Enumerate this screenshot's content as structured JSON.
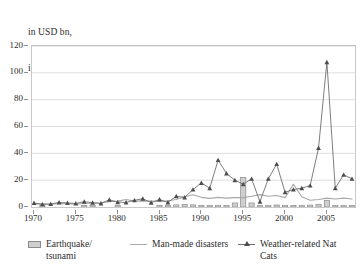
{
  "title": {
    "line1": "in USD bn,",
    "line2": "indexed to 2007"
  },
  "legend": {
    "items": [
      {
        "label": "Earthquake/\ntsunami",
        "marker": "bar-swatch-icon",
        "color": "#cfcfcf"
      },
      {
        "label": "Man-made disasters",
        "marker": "line-swatch-icon",
        "color": "#a8a8a8"
      },
      {
        "label": "Weather-related Nat\nCats",
        "marker": "line-triangle-swatch-icon",
        "color": "#6f6f6f"
      }
    ]
  },
  "chart_data": {
    "type": "line",
    "title": "in USD bn, indexed to 2007",
    "xlabel": "",
    "ylabel": "",
    "xlim": [
      1970,
      2008
    ],
    "ylim": [
      0,
      120
    ],
    "yticks": [
      0,
      20,
      40,
      60,
      80,
      100,
      120
    ],
    "xticks": [
      1970,
      1975,
      1980,
      1985,
      1990,
      1995,
      2000,
      2005
    ],
    "grid": true,
    "legend_position": "bottom",
    "x": [
      1970,
      1971,
      1972,
      1973,
      1974,
      1975,
      1976,
      1977,
      1978,
      1979,
      1980,
      1981,
      1982,
      1983,
      1984,
      1985,
      1986,
      1987,
      1988,
      1989,
      1990,
      1991,
      1992,
      1993,
      1994,
      1995,
      1996,
      1997,
      1998,
      1999,
      2000,
      2001,
      2002,
      2003,
      2004,
      2005,
      2006,
      2007,
      2008
    ],
    "series": [
      {
        "name": "Earthquake/tsunami",
        "type": "bar",
        "color": "#cfcfcf",
        "values": [
          0,
          0.3,
          0,
          0,
          0,
          0,
          0.5,
          0.4,
          0,
          0,
          0.3,
          0,
          0,
          0,
          0,
          1.2,
          1.0,
          1.6,
          2.0,
          1.6,
          1.2,
          0.5,
          0.6,
          0.6,
          3.0,
          22.0,
          3.0,
          0.4,
          0.5,
          1.5,
          0.6,
          0.5,
          0.4,
          1.4,
          2.0,
          5.0,
          1.0,
          0.4,
          0.6
        ]
      },
      {
        "name": "Man-made disasters",
        "type": "line",
        "color": "#a8a8a8",
        "values": [
          2.0,
          2.4,
          2.0,
          2.6,
          2.4,
          2.0,
          2.6,
          3.0,
          3.2,
          4.0,
          4.4,
          5.6,
          4.4,
          4.6,
          4.4,
          4.2,
          4.6,
          5.6,
          7.6,
          9.2,
          7.2,
          6.4,
          7.2,
          6.6,
          7.0,
          7.0,
          8.0,
          9.2,
          8.0,
          8.6,
          7.0,
          17.0,
          7.6,
          5.0,
          5.6,
          6.6,
          6.0,
          6.6,
          6.0
        ]
      },
      {
        "name": "Weather-related Nat Cats",
        "type": "line-marker",
        "color": "#6f6f6f",
        "values": [
          3.0,
          2.0,
          2.2,
          3.4,
          3.0,
          2.6,
          4.0,
          3.2,
          2.6,
          5.4,
          3.6,
          3.4,
          5.0,
          6.2,
          3.2,
          5.6,
          3.4,
          8.0,
          7.2,
          13.0,
          18.0,
          14.0,
          35.0,
          25.0,
          20.0,
          17.0,
          21.0,
          4.0,
          21.0,
          32.0,
          11.0,
          13.0,
          14.0,
          16.0,
          44.0,
          108.0,
          14.0,
          24.0,
          21.0
        ]
      }
    ]
  }
}
